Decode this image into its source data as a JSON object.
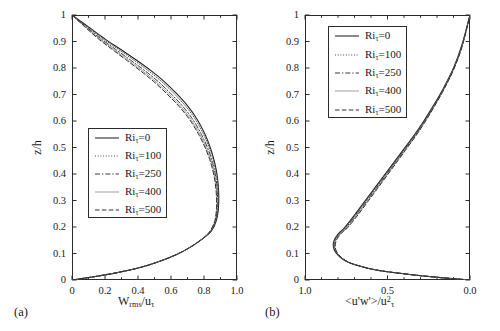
{
  "figure": {
    "panel_a_tag": "(a)",
    "panel_b_tag": "(b)"
  },
  "legend_entries": [
    {
      "label": "Ri",
      "sub": "τ",
      "value": "=0",
      "style": "solid"
    },
    {
      "label": "Ri",
      "sub": "τ",
      "value": "=100",
      "style": "dotted"
    },
    {
      "label": "Ri",
      "sub": "τ",
      "value": "=250",
      "style": "dashdot"
    },
    {
      "label": "Ri",
      "sub": "τ",
      "value": "=400",
      "style": "thin-solid"
    },
    {
      "label": "Ri",
      "sub": "τ",
      "value": "=500",
      "style": "dashed"
    }
  ],
  "chart_data": [
    {
      "type": "line",
      "panel": "a",
      "title": "",
      "xlabel": "W_rms/u_tau",
      "xlabel_parts": {
        "main": "W",
        "sub1": "rms",
        "mid": "/u",
        "sub2": "τ"
      },
      "ylabel": "z/h",
      "xlim": [
        0.0,
        1.0
      ],
      "ylim": [
        0.0,
        1.0
      ],
      "x_reversed": false,
      "grid": false,
      "legend_position": "center-left",
      "xticks": [
        0.0,
        0.2,
        0.4,
        0.6,
        0.8,
        1.0
      ],
      "xticklabels": [
        "0",
        "0.2",
        "0.4",
        "0.6",
        "0.8",
        "1.0"
      ],
      "xminorticks": [
        0.1,
        0.3,
        0.5,
        0.7,
        0.9
      ],
      "yticks": [
        0.0,
        0.1,
        0.2,
        0.3,
        0.4,
        0.5,
        0.6,
        0.7,
        0.8,
        0.9,
        1.0
      ],
      "yticklabels": [
        "0",
        "0.1",
        "0.2",
        "0.3",
        "0.4",
        "0.5",
        "0.6",
        "0.7",
        "0.8",
        "0.9",
        "1"
      ],
      "series": [
        {
          "name": "Ri_tau=0",
          "style": "solid",
          "x": [
            0.0,
            0.13,
            0.26,
            0.4,
            0.52,
            0.63,
            0.72,
            0.79,
            0.845,
            0.875,
            0.888,
            0.889,
            0.882,
            0.866,
            0.841,
            0.806,
            0.76,
            0.703,
            0.636,
            0.561,
            0.479,
            0.39,
            0.296,
            0.199,
            0.1,
            0.0
          ],
          "y": [
            0.0,
            0.012,
            0.026,
            0.045,
            0.068,
            0.095,
            0.125,
            0.155,
            0.185,
            0.225,
            0.275,
            0.33,
            0.385,
            0.44,
            0.495,
            0.55,
            0.605,
            0.655,
            0.702,
            0.748,
            0.79,
            0.83,
            0.87,
            0.91,
            0.955,
            1.0
          ]
        },
        {
          "name": "Ri_tau=100",
          "style": "dotted",
          "x": [
            0.0,
            0.13,
            0.26,
            0.4,
            0.52,
            0.63,
            0.72,
            0.79,
            0.843,
            0.873,
            0.886,
            0.886,
            0.878,
            0.861,
            0.834,
            0.797,
            0.749,
            0.69,
            0.621,
            0.545,
            0.462,
            0.374,
            0.282,
            0.188,
            0.094,
            0.0
          ],
          "y": [
            0.0,
            0.012,
            0.026,
            0.045,
            0.068,
            0.095,
            0.125,
            0.155,
            0.185,
            0.225,
            0.275,
            0.33,
            0.385,
            0.44,
            0.495,
            0.55,
            0.605,
            0.655,
            0.702,
            0.748,
            0.79,
            0.83,
            0.87,
            0.91,
            0.955,
            1.0
          ]
        },
        {
          "name": "Ri_tau=250",
          "style": "dashdot",
          "x": [
            0.0,
            0.13,
            0.26,
            0.4,
            0.52,
            0.63,
            0.72,
            0.79,
            0.841,
            0.87,
            0.882,
            0.881,
            0.872,
            0.853,
            0.824,
            0.784,
            0.733,
            0.672,
            0.601,
            0.524,
            0.441,
            0.354,
            0.265,
            0.176,
            0.087,
            0.0
          ],
          "y": [
            0.0,
            0.012,
            0.026,
            0.045,
            0.068,
            0.095,
            0.125,
            0.155,
            0.185,
            0.225,
            0.275,
            0.33,
            0.385,
            0.44,
            0.495,
            0.55,
            0.605,
            0.655,
            0.702,
            0.748,
            0.79,
            0.83,
            0.87,
            0.91,
            0.955,
            1.0
          ]
        },
        {
          "name": "Ri_tau=400",
          "style": "thin-solid",
          "x": [
            0.0,
            0.13,
            0.26,
            0.4,
            0.52,
            0.63,
            0.72,
            0.79,
            0.839,
            0.868,
            0.879,
            0.877,
            0.867,
            0.847,
            0.816,
            0.775,
            0.722,
            0.659,
            0.587,
            0.509,
            0.426,
            0.34,
            0.253,
            0.167,
            0.082,
            0.0
          ],
          "y": [
            0.0,
            0.012,
            0.026,
            0.045,
            0.068,
            0.095,
            0.125,
            0.155,
            0.185,
            0.225,
            0.275,
            0.33,
            0.385,
            0.44,
            0.495,
            0.55,
            0.605,
            0.655,
            0.702,
            0.748,
            0.79,
            0.83,
            0.87,
            0.91,
            0.955,
            1.0
          ]
        },
        {
          "name": "Ri_tau=500",
          "style": "dashed",
          "x": [
            0.0,
            0.13,
            0.26,
            0.4,
            0.52,
            0.63,
            0.72,
            0.79,
            0.837,
            0.866,
            0.876,
            0.874,
            0.863,
            0.842,
            0.81,
            0.767,
            0.713,
            0.649,
            0.576,
            0.497,
            0.414,
            0.329,
            0.244,
            0.16,
            0.078,
            0.0
          ],
          "y": [
            0.0,
            0.012,
            0.026,
            0.045,
            0.068,
            0.095,
            0.125,
            0.155,
            0.185,
            0.225,
            0.275,
            0.33,
            0.385,
            0.44,
            0.495,
            0.55,
            0.605,
            0.655,
            0.702,
            0.748,
            0.79,
            0.83,
            0.87,
            0.91,
            0.955,
            1.0
          ]
        }
      ]
    },
    {
      "type": "line",
      "panel": "b",
      "title": "",
      "xlabel": "<u'w'>/u^2_tau",
      "xlabel_parts": {
        "main": "<u'w'>/u",
        "sup": "2",
        "sub": "τ"
      },
      "ylabel": "z/h",
      "xlim": [
        1.0,
        0.0
      ],
      "ylim": [
        0.0,
        1.0
      ],
      "x_reversed": true,
      "grid": false,
      "legend_position": "top-left",
      "xticks": [
        1.0,
        0.5,
        0.0
      ],
      "xticklabels": [
        "1.0",
        "0.5",
        "0.0"
      ],
      "xminorticks": [
        0.9,
        0.8,
        0.7,
        0.6,
        0.4,
        0.3,
        0.2,
        0.1
      ],
      "yticks": [
        0.0,
        0.1,
        0.2,
        0.3,
        0.4,
        0.5,
        0.6,
        0.7,
        0.8,
        0.9,
        1.0
      ],
      "yticklabels": [
        "0",
        "0.1",
        "0.2",
        "0.3",
        "0.4",
        "0.5",
        "0.6",
        "0.7",
        "0.8",
        "0.9",
        "1"
      ],
      "series": [
        {
          "name": "Ri_tau=0",
          "style": "solid",
          "x": [
            0.0,
            0.16,
            0.31,
            0.45,
            0.57,
            0.66,
            0.735,
            0.785,
            0.815,
            0.828,
            0.826,
            0.812,
            0.79,
            0.76,
            0.7,
            0.64,
            0.58,
            0.52,
            0.46,
            0.4,
            0.34,
            0.28,
            0.22,
            0.16,
            0.1,
            0.05,
            0.0
          ],
          "y": [
            0.0,
            0.008,
            0.017,
            0.027,
            0.038,
            0.051,
            0.066,
            0.085,
            0.105,
            0.125,
            0.145,
            0.163,
            0.18,
            0.198,
            0.245,
            0.295,
            0.345,
            0.395,
            0.445,
            0.495,
            0.545,
            0.6,
            0.66,
            0.725,
            0.8,
            0.885,
            1.0
          ]
        },
        {
          "name": "Ri_tau=100",
          "style": "dotted",
          "x": [
            0.0,
            0.16,
            0.31,
            0.45,
            0.57,
            0.66,
            0.735,
            0.785,
            0.813,
            0.826,
            0.823,
            0.809,
            0.786,
            0.756,
            0.696,
            0.636,
            0.576,
            0.516,
            0.456,
            0.396,
            0.337,
            0.277,
            0.218,
            0.158,
            0.099,
            0.049,
            0.0
          ],
          "y": [
            0.0,
            0.008,
            0.017,
            0.027,
            0.038,
            0.051,
            0.066,
            0.085,
            0.105,
            0.125,
            0.145,
            0.163,
            0.18,
            0.198,
            0.245,
            0.295,
            0.345,
            0.395,
            0.445,
            0.495,
            0.545,
            0.6,
            0.66,
            0.725,
            0.8,
            0.885,
            1.0
          ]
        },
        {
          "name": "Ri_tau=250",
          "style": "dashdot",
          "x": [
            0.0,
            0.16,
            0.31,
            0.45,
            0.57,
            0.66,
            0.735,
            0.783,
            0.811,
            0.823,
            0.82,
            0.805,
            0.782,
            0.751,
            0.69,
            0.63,
            0.57,
            0.51,
            0.451,
            0.392,
            0.333,
            0.274,
            0.215,
            0.156,
            0.097,
            0.048,
            0.0
          ],
          "y": [
            0.0,
            0.008,
            0.017,
            0.027,
            0.038,
            0.051,
            0.066,
            0.085,
            0.105,
            0.125,
            0.145,
            0.163,
            0.18,
            0.198,
            0.245,
            0.295,
            0.345,
            0.395,
            0.445,
            0.495,
            0.545,
            0.6,
            0.66,
            0.725,
            0.8,
            0.885,
            1.0
          ]
        },
        {
          "name": "Ri_tau=400",
          "style": "thin-solid",
          "x": [
            0.0,
            0.16,
            0.31,
            0.45,
            0.57,
            0.66,
            0.733,
            0.781,
            0.808,
            0.82,
            0.817,
            0.801,
            0.778,
            0.746,
            0.685,
            0.625,
            0.565,
            0.506,
            0.447,
            0.388,
            0.33,
            0.271,
            0.213,
            0.154,
            0.096,
            0.047,
            0.0
          ],
          "y": [
            0.0,
            0.008,
            0.017,
            0.027,
            0.038,
            0.051,
            0.066,
            0.085,
            0.105,
            0.125,
            0.145,
            0.163,
            0.18,
            0.198,
            0.245,
            0.295,
            0.345,
            0.395,
            0.445,
            0.495,
            0.545,
            0.6,
            0.66,
            0.725,
            0.8,
            0.885,
            1.0
          ]
        },
        {
          "name": "Ri_tau=500",
          "style": "dashed",
          "x": [
            0.0,
            0.16,
            0.31,
            0.45,
            0.57,
            0.66,
            0.731,
            0.779,
            0.806,
            0.817,
            0.813,
            0.797,
            0.773,
            0.741,
            0.68,
            0.62,
            0.561,
            0.502,
            0.443,
            0.385,
            0.327,
            0.269,
            0.211,
            0.153,
            0.095,
            0.046,
            0.0
          ],
          "y": [
            0.0,
            0.008,
            0.017,
            0.027,
            0.038,
            0.051,
            0.066,
            0.085,
            0.105,
            0.125,
            0.145,
            0.163,
            0.18,
            0.198,
            0.245,
            0.295,
            0.345,
            0.395,
            0.445,
            0.495,
            0.545,
            0.6,
            0.66,
            0.725,
            0.8,
            0.885,
            1.0
          ]
        }
      ]
    }
  ]
}
